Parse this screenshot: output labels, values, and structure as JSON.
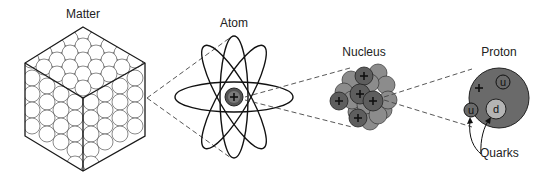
{
  "diagram": {
    "stages": [
      {
        "id": "matter",
        "label": "Matter"
      },
      {
        "id": "atom",
        "label": "Atom"
      },
      {
        "id": "nucleus",
        "label": "Nucleus"
      },
      {
        "id": "proton",
        "label": "Proton"
      }
    ],
    "proton": {
      "charge_symbol": "+",
      "quarks": [
        {
          "label": "u",
          "type": "up"
        },
        {
          "label": "u",
          "type": "up"
        },
        {
          "label": "d",
          "type": "down"
        }
      ],
      "quarks_caption": "Quarks"
    },
    "nucleus": {
      "proton_symbol": "+",
      "proton_count_visible": 5
    },
    "atom": {
      "nucleus_symbol": "+",
      "orbit_count": 3
    },
    "colors": {
      "line": "#111111",
      "dashed_connector": "#444444",
      "neutron_fill": "#8c8c8c",
      "proton_fill": "#5e5e5e",
      "proton_large_fill": "#6a6a6a",
      "quark_d_fill": "#b4b4b4",
      "background": "#ffffff"
    }
  }
}
